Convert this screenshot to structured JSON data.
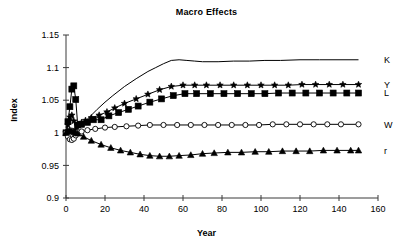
{
  "chart_data": {
    "type": "line",
    "title": "Macro Effects",
    "xlabel": "Year",
    "ylabel": "Index",
    "xlim": [
      0,
      160
    ],
    "ylim": [
      0.9,
      1.15
    ],
    "xticks": [
      0,
      20,
      40,
      60,
      80,
      100,
      120,
      140,
      160
    ],
    "yticks": [
      0.9,
      0.95,
      1,
      1.05,
      1.1,
      1.15
    ],
    "xtick_labels": [
      "0",
      "20",
      "40",
      "60",
      "80",
      "100",
      "120",
      "140",
      "160"
    ],
    "ytick_labels": [
      "0.9",
      "0.95",
      "1",
      "1.05",
      "1.1",
      "1.15"
    ],
    "grid": false,
    "legend_position": "right-of-line-ends",
    "series": [
      {
        "name": "K",
        "label": "K",
        "marker": "none",
        "color": "#000000",
        "x": [
          0,
          1,
          2,
          3,
          4,
          5,
          6,
          8,
          10,
          12,
          16,
          20,
          24,
          30,
          36,
          42,
          46,
          50,
          54,
          58,
          62,
          66,
          70,
          78,
          86,
          94,
          102,
          110,
          120,
          130,
          140,
          150
        ],
        "y": [
          1.0,
          1.0,
          1.0,
          1.001,
          1.002,
          1.004,
          1.007,
          1.012,
          1.018,
          1.024,
          1.036,
          1.047,
          1.057,
          1.071,
          1.083,
          1.094,
          1.1,
          1.106,
          1.111,
          1.112,
          1.111,
          1.11,
          1.109,
          1.109,
          1.11,
          1.11,
          1.111,
          1.111,
          1.112,
          1.112,
          1.112,
          1.112
        ]
      },
      {
        "name": "Y",
        "label": "Y",
        "marker": "star",
        "color": "#000000",
        "x": [
          0,
          1,
          2,
          3,
          4,
          5,
          6,
          8,
          10,
          13,
          17,
          21,
          25,
          30,
          36,
          42,
          48,
          54,
          60,
          66,
          72,
          79,
          86,
          93,
          100,
          107,
          114,
          121,
          128,
          135,
          142,
          150
        ],
        "y": [
          1.0,
          1.012,
          1.024,
          1.027,
          1.018,
          1.005,
          1.012,
          1.016,
          1.019,
          1.023,
          1.027,
          1.032,
          1.038,
          1.045,
          1.052,
          1.059,
          1.066,
          1.071,
          1.073,
          1.073,
          1.073,
          1.073,
          1.073,
          1.073,
          1.073,
          1.073,
          1.073,
          1.074,
          1.074,
          1.074,
          1.074,
          1.074
        ]
      },
      {
        "name": "L",
        "label": "L",
        "marker": "square",
        "color": "#000000",
        "x": [
          0,
          1,
          2,
          3,
          4,
          5,
          6,
          8,
          11,
          14,
          18,
          22,
          27,
          32,
          37,
          43,
          49,
          55,
          61,
          67,
          74,
          81,
          88,
          95,
          102,
          109,
          116,
          123,
          130,
          137,
          144,
          150
        ],
        "y": [
          1.0,
          1.017,
          1.04,
          1.067,
          1.072,
          1.051,
          1.012,
          1.013,
          1.016,
          1.02,
          1.02,
          1.026,
          1.031,
          1.036,
          1.041,
          1.047,
          1.052,
          1.057,
          1.06,
          1.06,
          1.06,
          1.06,
          1.06,
          1.06,
          1.06,
          1.061,
          1.061,
          1.061,
          1.061,
          1.061,
          1.061,
          1.061
        ]
      },
      {
        "name": "W",
        "label": "W",
        "marker": "circle-open",
        "color": "#000000",
        "x": [
          0,
          1,
          2,
          3,
          4,
          5,
          6,
          8,
          11,
          15,
          20,
          25,
          31,
          37,
          43,
          50,
          57,
          64,
          71,
          78,
          85,
          92,
          99,
          106,
          113,
          120,
          127,
          134,
          141,
          150
        ],
        "y": [
          1.0,
          0.994,
          0.99,
          0.989,
          0.991,
          0.996,
          1.001,
          1.002,
          1.004,
          1.006,
          1.008,
          1.009,
          1.01,
          1.011,
          1.012,
          1.012,
          1.012,
          1.012,
          1.012,
          1.012,
          1.012,
          1.012,
          1.012,
          1.013,
          1.013,
          1.013,
          1.013,
          1.013,
          1.013,
          1.013
        ]
      },
      {
        "name": "r",
        "label": "r",
        "marker": "triangle",
        "color": "#000000",
        "x": [
          0,
          1,
          2,
          3,
          4,
          5,
          6,
          9,
          13,
          18,
          23,
          28,
          33,
          38,
          43,
          48,
          53,
          58,
          64,
          70,
          76,
          83,
          90,
          97,
          104,
          111,
          118,
          125,
          132,
          139,
          146,
          150
        ],
        "y": [
          1.0,
          1.003,
          1.004,
          1.003,
          1.001,
          1.0,
          0.999,
          0.994,
          0.988,
          0.982,
          0.977,
          0.973,
          0.97,
          0.967,
          0.965,
          0.964,
          0.964,
          0.965,
          0.966,
          0.968,
          0.969,
          0.97,
          0.97,
          0.971,
          0.971,
          0.972,
          0.972,
          0.972,
          0.973,
          0.973,
          0.973,
          0.973
        ]
      }
    ],
    "series_end_labels": [
      {
        "name": "K",
        "label": "K",
        "value": 1.112
      },
      {
        "name": "Y",
        "label": "Y",
        "value": 1.074
      },
      {
        "name": "L",
        "label": "L",
        "value": 1.061
      },
      {
        "name": "W",
        "label": "W",
        "value": 1.013
      },
      {
        "name": "r",
        "label": "r",
        "value": 0.973
      }
    ]
  },
  "colors": {
    "background": "#ffffff",
    "axis": "#3a3a3a",
    "line": "#000000"
  }
}
